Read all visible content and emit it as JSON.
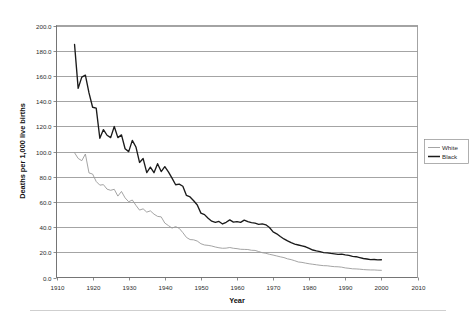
{
  "chart_data": {
    "type": "line",
    "title": "",
    "xlabel": "Year",
    "ylabel": "Deaths per 1,000 live births",
    "xlim": [
      1910,
      2010
    ],
    "ylim": [
      0,
      200
    ],
    "grid": "horizontal",
    "legend_position": "right",
    "xticks": [
      "1910",
      "1920",
      "1930",
      "1940",
      "1950",
      "1960",
      "1970",
      "1980",
      "1990",
      "2000",
      "2010"
    ],
    "yticks": [
      "0.0",
      "20.0",
      "40.0",
      "60.0",
      "80.0",
      "100.0",
      "120.0",
      "140.0",
      "160.0",
      "180.0",
      "200.0"
    ],
    "x": [
      1915,
      1916,
      1917,
      1918,
      1919,
      1920,
      1921,
      1922,
      1923,
      1924,
      1925,
      1926,
      1927,
      1928,
      1929,
      1930,
      1931,
      1932,
      1933,
      1934,
      1935,
      1936,
      1937,
      1938,
      1939,
      1940,
      1941,
      1942,
      1943,
      1944,
      1945,
      1946,
      1947,
      1948,
      1949,
      1950,
      1951,
      1952,
      1953,
      1954,
      1955,
      1956,
      1957,
      1958,
      1959,
      1960,
      1961,
      1962,
      1963,
      1964,
      1965,
      1966,
      1967,
      1968,
      1969,
      1970,
      1971,
      1972,
      1973,
      1974,
      1975,
      1976,
      1977,
      1978,
      1979,
      1980,
      1981,
      1982,
      1983,
      1984,
      1985,
      1986,
      1987,
      1988,
      1989,
      1990,
      1991,
      1992,
      1993,
      1994,
      1995,
      1996,
      1997,
      1998,
      1999,
      2000
    ],
    "series": [
      {
        "name": "Black",
        "color": "#1b1b1b",
        "linewidth": "thick",
        "values": [
          184.9,
          150.1,
          159.0,
          160.6,
          146.5,
          135.1,
          134.4,
          110.5,
          117.4,
          112.9,
          111.0,
          119.8,
          111.0,
          113.2,
          102.2,
          99.9,
          108.8,
          103.6,
          91.3,
          94.4,
          83.2,
          87.6,
          83.2,
          90.3,
          84.1,
          88.0,
          83.8,
          78.9,
          73.6,
          74.1,
          72.4,
          65.1,
          63.9,
          60.9,
          57.5,
          51.1,
          49.9,
          47.0,
          44.7,
          43.7,
          44.5,
          42.5,
          43.8,
          45.7,
          44.0,
          44.3,
          43.7,
          45.5,
          44.3,
          43.5,
          43.1,
          42.2,
          42.5,
          41.8,
          39.7,
          36.2,
          34.7,
          32.5,
          30.6,
          29.0,
          27.6,
          26.5,
          25.8,
          25.1,
          24.4,
          23.1,
          21.8,
          21.1,
          20.5,
          19.8,
          19.5,
          19.1,
          18.8,
          18.3,
          18.6,
          18.0,
          17.6,
          16.8,
          16.5,
          15.8,
          15.1,
          14.7,
          14.2,
          14.3,
          14.0,
          14.1
        ]
      },
      {
        "name": "White",
        "color": "#9a9a9a",
        "linewidth": "thin",
        "values": [
          99.0,
          94.5,
          92.7,
          98.0,
          83.0,
          82.1,
          76.2,
          73.3,
          73.7,
          70.1,
          69.2,
          70.0,
          64.6,
          68.3,
          63.2,
          60.1,
          61.5,
          57.3,
          53.5,
          54.5,
          51.9,
          52.9,
          50.3,
          48.5,
          48.1,
          43.2,
          41.2,
          39.2,
          40.4,
          39.0,
          35.6,
          31.8,
          30.1,
          29.9,
          28.9,
          26.8,
          25.8,
          25.5,
          25.0,
          24.2,
          23.6,
          23.2,
          23.3,
          23.8,
          23.2,
          22.9,
          22.4,
          22.3,
          22.2,
          21.6,
          21.5,
          20.6,
          19.7,
          19.2,
          18.4,
          17.8,
          17.1,
          16.4,
          15.8,
          14.8,
          14.2,
          13.3,
          12.3,
          12.0,
          11.4,
          10.9,
          10.5,
          10.1,
          9.7,
          9.4,
          9.3,
          8.9,
          8.6,
          8.5,
          8.2,
          7.6,
          7.3,
          6.9,
          6.8,
          6.6,
          6.3,
          6.1,
          6.0,
          6.0,
          5.8,
          5.7
        ]
      }
    ]
  },
  "legend": {
    "items": [
      {
        "label": "White",
        "swatch": "thin-gray-line"
      },
      {
        "label": "Black",
        "swatch": "thick-black-line"
      }
    ]
  },
  "axes": {
    "x_title": "Year",
    "y_title": "Deaths per 1,000 live births"
  }
}
